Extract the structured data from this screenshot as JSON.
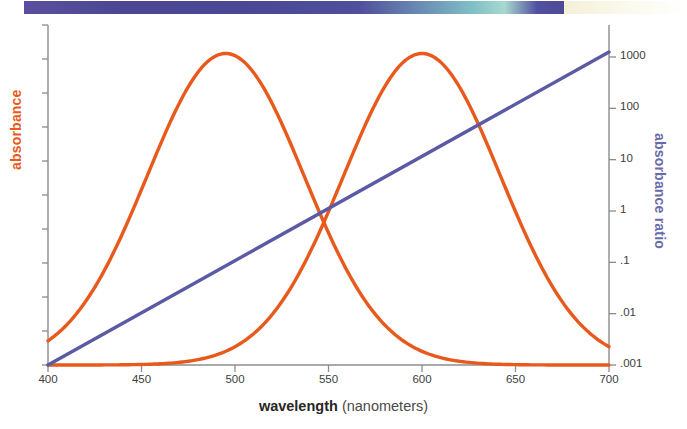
{
  "banner": {
    "name": "decorative-gradient-banner",
    "left_gradient_colors": [
      "#5a4f9e",
      "#4b4793",
      "#7fbfc6",
      "#a8d8cf",
      "#4d4a96"
    ],
    "right_gradient_colors": [
      "#f3f0d8",
      "#ffffff"
    ]
  },
  "chart_data": {
    "type": "line",
    "title": "",
    "subtitle": "",
    "xlabel_strong": "wavelength",
    "xlabel_paren": "(nanometers)",
    "ylabel_left": "absorbance",
    "ylabel_right": "absorbance ratio",
    "x": [
      400,
      450,
      500,
      550,
      600,
      650,
      700
    ],
    "xlim": [
      400,
      700
    ],
    "xticks": [
      "400",
      "450",
      "500",
      "550",
      "600",
      "650",
      "700"
    ],
    "left_axis": {
      "label": "absorbance",
      "color": "#e8591c",
      "scale": "linear",
      "tick_count": 11,
      "ticks_labeled": false,
      "ylim": [
        0,
        1
      ]
    },
    "right_axis": {
      "label": "absorbance ratio",
      "color": "#6a6aa8",
      "scale": "log",
      "ticks": [
        "1000",
        "100",
        "10",
        "1",
        ".1",
        ".01",
        ".001"
      ],
      "tick_values": [
        1000,
        100,
        10,
        1,
        0.1,
        0.01,
        0.001
      ],
      "ylim": [
        0.001,
        1000
      ]
    },
    "grid": false,
    "legend": "none",
    "series": [
      {
        "name": "absorbance-peak-495",
        "color": "#e8591c",
        "axis": "left",
        "peak_x": 495,
        "peak_y": 0.93,
        "type": "gaussian",
        "sigma": 42,
        "baseline": 0.0,
        "x": [
          400,
          410,
          420,
          430,
          440,
          450,
          460,
          470,
          480,
          490,
          495,
          500,
          510,
          520,
          530,
          540,
          550,
          560,
          570,
          580,
          590,
          600,
          620,
          640,
          660,
          680,
          700
        ],
        "values": [
          0.13,
          0.18,
          0.25,
          0.33,
          0.43,
          0.54,
          0.66,
          0.76,
          0.85,
          0.92,
          0.93,
          0.93,
          0.89,
          0.82,
          0.73,
          0.62,
          0.5,
          0.39,
          0.29,
          0.21,
          0.14,
          0.09,
          0.035,
          0.012,
          0.004,
          0.001,
          0.0
        ]
      },
      {
        "name": "absorbance-peak-600",
        "color": "#e8591c",
        "axis": "left",
        "peak_x": 600,
        "peak_y": 0.93,
        "type": "gaussian",
        "sigma": 42,
        "baseline": 0.0,
        "x": [
          400,
          420,
          440,
          460,
          480,
          490,
          500,
          510,
          520,
          530,
          540,
          550,
          560,
          570,
          580,
          590,
          600,
          610,
          620,
          630,
          640,
          650,
          660,
          670,
          680,
          690,
          700
        ],
        "values": [
          0.0,
          0.001,
          0.004,
          0.012,
          0.035,
          0.05,
          0.09,
          0.14,
          0.21,
          0.29,
          0.39,
          0.5,
          0.62,
          0.73,
          0.82,
          0.89,
          0.93,
          0.93,
          0.89,
          0.82,
          0.73,
          0.62,
          0.5,
          0.39,
          0.29,
          0.21,
          0.15
        ]
      },
      {
        "name": "absorbance-ratio-line",
        "color": "#5a5aa5",
        "axis": "right",
        "type": "log-linear",
        "x": [
          400,
          450,
          500,
          550,
          600,
          650,
          700
        ],
        "values": [
          0.001,
          0.0215,
          0.464,
          10.0,
          215.0,
          4640.0,
          100000.0
        ],
        "note": "straight line on log axis from bottom-left to upper-right"
      }
    ],
    "annotations": [
      {
        "name": "curve-crossing",
        "x": 548,
        "description": "the two absorbance curves cross"
      }
    ]
  },
  "colors": {
    "orange": "#e8591c",
    "purple": "#5a5aa5",
    "axis": "#8c8c8c",
    "text": "#3d3d3d"
  }
}
